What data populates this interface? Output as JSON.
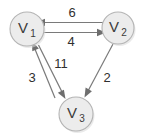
{
  "diagram": {
    "type": "directed-weighted-graph",
    "title": "",
    "background_color": "#ffffff",
    "node_fill_color": "#ececec",
    "node_stroke_color": "#b4b4b4",
    "edge_color": "#7a7a7a",
    "label_color": "#2f2f2f",
    "nodes": [
      {
        "id": "V1",
        "main": "V",
        "sub": "1",
        "label": "V1",
        "cx": 27,
        "cy": 29,
        "r": 17
      },
      {
        "id": "V2",
        "main": "V",
        "sub": "2",
        "label": "V2",
        "cx": 118,
        "cy": 28,
        "r": 16
      },
      {
        "id": "V3",
        "main": "V",
        "sub": "3",
        "label": "V3",
        "cx": 76,
        "cy": 114,
        "r": 17
      }
    ],
    "edges": [
      {
        "id": "e-v2-v1",
        "from": "V2",
        "to": "V1",
        "weight": "6",
        "weight_x": 72,
        "weight_y": 14
      },
      {
        "id": "e-v1-v2",
        "from": "V1",
        "to": "V2",
        "weight": "4",
        "weight_x": 71,
        "weight_y": 43
      },
      {
        "id": "e-v1-v3",
        "from": "V1",
        "to": "V3",
        "weight": "11",
        "weight_x": 61,
        "weight_y": 65
      },
      {
        "id": "e-v3-v1",
        "from": "V3",
        "to": "V1",
        "weight": "3",
        "weight_x": 32,
        "weight_y": 79
      },
      {
        "id": "e-v2-v3",
        "from": "V2",
        "to": "V3",
        "weight": "2",
        "weight_x": 107,
        "weight_y": 79
      }
    ]
  }
}
